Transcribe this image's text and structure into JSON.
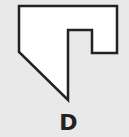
{
  "figure": {
    "label": "D",
    "shape": {
      "points": "19,6 117,6 117,53 92,53 92,30 68,30 68,100 19,52",
      "fill": "#ffffff",
      "stroke": "#222222"
    },
    "background": "#e9e9e9"
  }
}
